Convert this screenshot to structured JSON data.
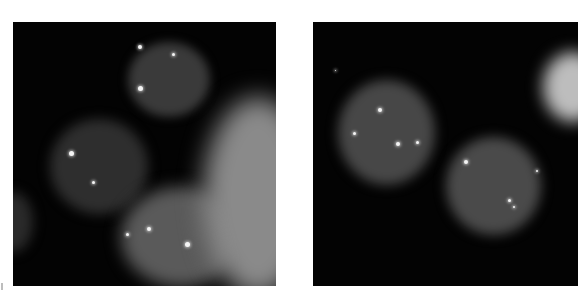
{
  "figure": {
    "panels": [
      {
        "id": "left",
        "box": {
          "x": 13,
          "y": 22,
          "w": 263,
          "h": 264
        },
        "background": "#030303",
        "cells": [
          {
            "x": 115,
            "y": 20,
            "w": 82,
            "h": 75,
            "color": "#3a3a3a",
            "blur": 5
          },
          {
            "x": 37,
            "y": 97,
            "w": 98,
            "h": 95,
            "color": "#2e2e2e",
            "blur": 6
          },
          {
            "x": 108,
            "y": 165,
            "w": 120,
            "h": 100,
            "color": "#5a5a5a",
            "blur": 8
          },
          {
            "x": 190,
            "y": 75,
            "w": 110,
            "h": 200,
            "color": "#8a8a8a",
            "blur": 12
          },
          {
            "x": -20,
            "y": 170,
            "w": 40,
            "h": 60,
            "color": "#2a2a2a",
            "blur": 6
          }
        ],
        "spots": [
          {
            "x": 127,
            "y": 25,
            "r": 4
          },
          {
            "x": 160,
            "y": 32,
            "r": 3
          },
          {
            "x": 127,
            "y": 66,
            "r": 5
          },
          {
            "x": 58,
            "y": 131,
            "r": 5
          },
          {
            "x": 80,
            "y": 160,
            "r": 3
          },
          {
            "x": 136,
            "y": 207,
            "r": 4
          },
          {
            "x": 114,
            "y": 212,
            "r": 3
          },
          {
            "x": 174,
            "y": 222,
            "r": 5
          }
        ]
      },
      {
        "id": "right",
        "box": {
          "x": 313,
          "y": 22,
          "w": 265,
          "h": 264
        },
        "background": "#030303",
        "cells": [
          {
            "x": 25,
            "y": 58,
            "w": 97,
            "h": 105,
            "color": "#474747",
            "blur": 6
          },
          {
            "x": 133,
            "y": 115,
            "w": 95,
            "h": 98,
            "color": "#4a4a4a",
            "blur": 6
          },
          {
            "x": 230,
            "y": 30,
            "w": 60,
            "h": 70,
            "color": "#bdbdbd",
            "blur": 8
          }
        ],
        "spots": [
          {
            "x": 67,
            "y": 88,
            "r": 4
          },
          {
            "x": 41,
            "y": 111,
            "r": 3
          },
          {
            "x": 85,
            "y": 122,
            "r": 4
          },
          {
            "x": 104,
            "y": 120,
            "r": 3
          },
          {
            "x": 153,
            "y": 140,
            "r": 4
          },
          {
            "x": 224,
            "y": 149,
            "r": 2
          },
          {
            "x": 196,
            "y": 178,
            "r": 3
          },
          {
            "x": 201,
            "y": 185,
            "r": 2
          },
          {
            "x": 22,
            "y": 48,
            "r": 1
          }
        ]
      }
    ]
  }
}
